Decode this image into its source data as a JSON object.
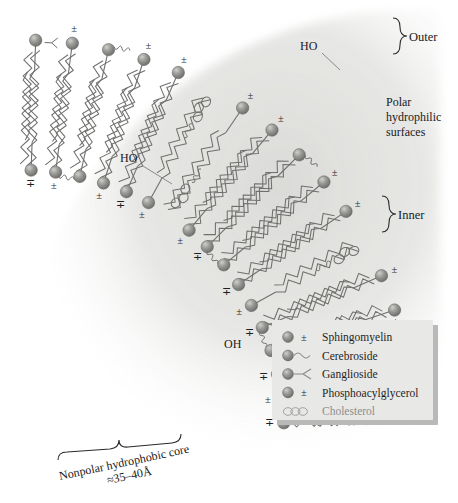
{
  "figure": {
    "kind": "lipid-bilayer-cross-section",
    "title_visible": false
  },
  "annotations": {
    "outer": "Outer",
    "inner": "Inner",
    "polar_surfaces_line1": "Polar",
    "polar_surfaces_line2": "hydrophilic",
    "polar_surfaces_line3": "surfaces",
    "core_line1": "Nonpolar hydrophobic core",
    "core_line2": "≈35–40Å",
    "ho_top": "HO",
    "ho_left": "HO",
    "oh_inner": "OH"
  },
  "charges": {
    "plus_over_minus": "±",
    "minus_over_plus": "∓",
    "plus": "+",
    "minus": "−"
  },
  "legend": {
    "items": [
      {
        "icon": "sphere-with-charge-icon",
        "label": "Sphingomyelin",
        "muted": false
      },
      {
        "icon": "sphere-with-squiggle-icon",
        "label": "Cerebroside",
        "muted": false
      },
      {
        "icon": "sphere-with-fork-icon",
        "label": "Ganglioside",
        "muted": false
      },
      {
        "icon": "sphere-with-charge-icon",
        "label": "Phosphoacylglycerol",
        "muted": false
      },
      {
        "icon": "fused-rings-icon",
        "label": "Cholesterol",
        "muted": true
      }
    ]
  },
  "colors": {
    "head_group": "#8e8e8c",
    "head_group_highlight": "#c9c9c6",
    "tail_stroke": "#6f6f6d",
    "legend_bg": "#e8e8e6",
    "legend_shadow": "#b9b9b7",
    "text": "#1f1f1f",
    "muted_text": "#8d8d8d",
    "wash": "#d7d7d4"
  }
}
